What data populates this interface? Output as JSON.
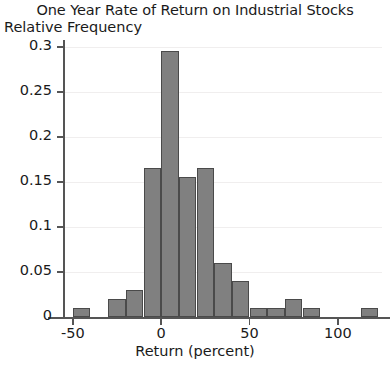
{
  "chart_data": {
    "type": "bar",
    "title": "One Year Rate of Return on Industrial Stocks",
    "xlabel": "Return (percent)",
    "ylabel": "Relative Frequency",
    "grid": true,
    "legend": null,
    "xlim": [
      -55,
      125
    ],
    "ylim": [
      0,
      0.305
    ],
    "bin_width": 10,
    "xticks": [
      -50,
      0,
      50,
      100
    ],
    "xtick_labels": [
      "-50",
      "0",
      "50",
      "100"
    ],
    "yticks": [
      0,
      0.05,
      0.1,
      0.15,
      0.2,
      0.25,
      0.3
    ],
    "ytick_labels": [
      "0",
      "0.05",
      "0.1",
      "0.15",
      "0.2",
      "0.25",
      "0.3"
    ],
    "bars": [
      {
        "bin_start": -50,
        "bin_end": -40,
        "value": 0.01
      },
      {
        "bin_start": -30,
        "bin_end": -20,
        "value": 0.02
      },
      {
        "bin_start": -20,
        "bin_end": -10,
        "value": 0.03
      },
      {
        "bin_start": -10,
        "bin_end": 0,
        "value": 0.165
      },
      {
        "bin_start": 0,
        "bin_end": 10,
        "value": 0.295
      },
      {
        "bin_start": 10,
        "bin_end": 20,
        "value": 0.155
      },
      {
        "bin_start": 20,
        "bin_end": 30,
        "value": 0.165
      },
      {
        "bin_start": 30,
        "bin_end": 40,
        "value": 0.06
      },
      {
        "bin_start": 40,
        "bin_end": 50,
        "value": 0.04
      },
      {
        "bin_start": 50,
        "bin_end": 60,
        "value": 0.01
      },
      {
        "bin_start": 60,
        "bin_end": 70,
        "value": 0.01
      },
      {
        "bin_start": 70,
        "bin_end": 80,
        "value": 0.02
      },
      {
        "bin_start": 80,
        "bin_end": 90,
        "value": 0.01
      },
      {
        "bin_start": 113,
        "bin_end": 123,
        "value": 0.01
      }
    ],
    "colors": {
      "bar_fill": "#808080",
      "bar_edge": "#4a4a4a",
      "axis": "#555555",
      "grid": "#f0eeee",
      "text": "#1a1a1a",
      "background": "#ffffff"
    }
  }
}
